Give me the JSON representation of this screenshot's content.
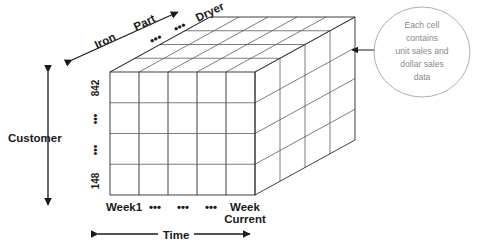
{
  "diagram": {
    "axes": {
      "vertical": {
        "name": "Customer",
        "ticks": [
          "842",
          "•••",
          "•••",
          "148"
        ]
      },
      "horizontal": {
        "name": "Time",
        "ticks": [
          "Week1",
          "•••",
          "•••",
          "•••",
          "Week Current"
        ],
        "tick_last_line1": "Week",
        "tick_last_line2": "Current"
      },
      "depth": {
        "name": "Part",
        "ticks": [
          "Iron",
          "•••",
          "•••",
          "Dryer"
        ]
      }
    },
    "callout": {
      "lines": [
        "Each cell",
        "contains",
        "unit sales and",
        "dollar sales",
        "data"
      ]
    },
    "grid": {
      "columns": 5,
      "rows": 4,
      "layers": 4
    },
    "colors": {
      "line": "#2b2b2b",
      "line_soft": "#5c5c5c",
      "text": "#1a1a1a",
      "callout_text": "#8a8a8a",
      "callout_border": "#9a9a9a",
      "background": "#ffffff"
    }
  }
}
